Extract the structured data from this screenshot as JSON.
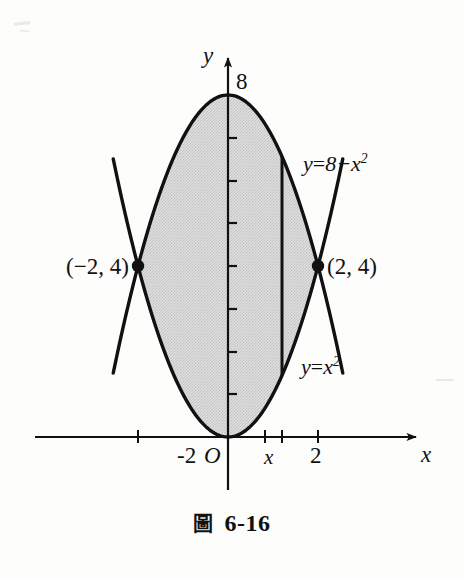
{
  "figure": {
    "caption_mark": "圖",
    "caption_number": "6-16"
  },
  "axes": {
    "y_axis_label": "y",
    "x_axis_label": "x",
    "origin_label": "O",
    "y_top_tick_label": "8",
    "x_tick_neg2_label": "-2",
    "x_tick_2_label": "2",
    "x_strip_label": "x"
  },
  "points": {
    "left_intersection_label": "(−2, 4)",
    "right_intersection_label": "(2, 4)"
  },
  "curves": {
    "upper": {
      "label_lhs": "y",
      "label_eq": "=",
      "label_rhs_base": "8−x",
      "label_rhs_exp": "2",
      "equation_text": "y = 8−x²"
    },
    "lower": {
      "label_lhs": "y",
      "label_eq": "=",
      "label_rhs_base": "x",
      "label_rhs_exp": "2",
      "equation_text": "y = x²"
    }
  },
  "colors": {
    "ink": "#111111",
    "shade_fill": "#d2d2d2",
    "background": "#fdfdfc"
  },
  "chart_data": {
    "type": "line",
    "xlabel": "x",
    "ylabel": "y",
    "xlim": [
      -4.3,
      4.4
    ],
    "ylim": [
      -1.4,
      9.8
    ],
    "grid": false,
    "legend": "inline-curve-labels",
    "xticks": [
      -2,
      2
    ],
    "xticklabels": [
      "-2",
      "2"
    ],
    "yticks": [
      1,
      2,
      3,
      4,
      5,
      6,
      7,
      8
    ],
    "yticklabels": [
      "",
      "",
      "",
      "",
      "",
      "",
      "",
      "8"
    ],
    "series": [
      {
        "name": "y = 8−x²",
        "type": "parabola",
        "equation": "y = 8 - x^2",
        "domain": [
          -2.55,
          2.55
        ],
        "vertex": [
          0,
          8
        ],
        "opens": "down"
      },
      {
        "name": "y = x²",
        "type": "parabola",
        "equation": "y = x^2",
        "domain": [
          -2.55,
          2.55
        ],
        "vertex": [
          0,
          0
        ],
        "opens": "up"
      }
    ],
    "shaded_region": {
      "between": [
        "y = x²",
        "y = 8−x²"
      ],
      "x_range": [
        -2,
        2
      ],
      "fill": "#d2d2d2"
    },
    "annotations": [
      {
        "text": "(−2, 4)",
        "x": -2,
        "y": 4,
        "marker": "filled-dot"
      },
      {
        "text": "(2, 4)",
        "x": 2,
        "y": 4,
        "marker": "filled-dot"
      }
    ],
    "representative_strip": {
      "x": 1.2,
      "y_bottom": 1.44,
      "y_top": 6.56,
      "label": "x"
    }
  }
}
